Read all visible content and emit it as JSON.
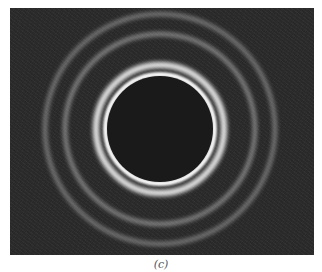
{
  "figure": {
    "caption": "(c)",
    "background_color": "#2b2b2b",
    "center": {
      "x": 150,
      "y": 121
    },
    "rings": [
      {
        "name": "outer-ring",
        "radius": 117,
        "width": 4,
        "color": "rgba(200,200,200,0.55)",
        "blur": 2
      },
      {
        "name": "second-ring",
        "radius": 97,
        "width": 4,
        "color": "rgba(210,210,210,0.6)",
        "blur": 2
      },
      {
        "name": "bright-ring-outer",
        "radius": 67,
        "width": 6,
        "color": "#eeeeee",
        "blur": 2
      },
      {
        "name": "bright-ring-inner",
        "radius": 57,
        "width": 5,
        "color": "#f4f4f4",
        "blur": 1
      }
    ],
    "central_disk": {
      "radius": 53,
      "color": "#1a1a1a"
    }
  }
}
